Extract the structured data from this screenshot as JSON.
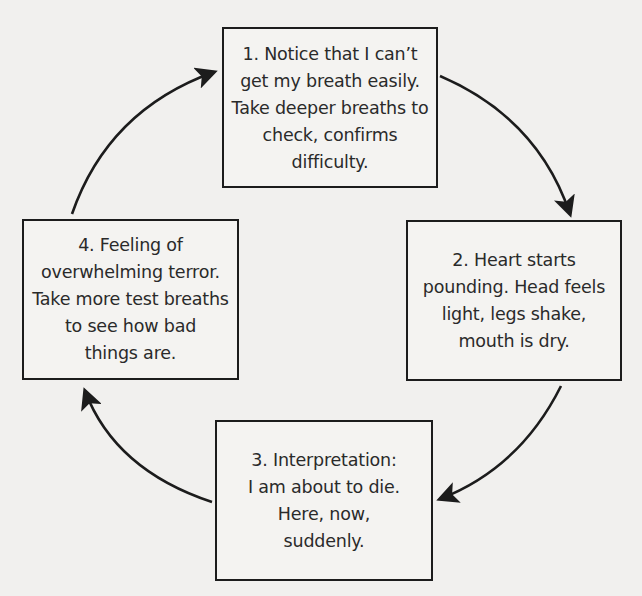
{
  "diagram": {
    "type": "cycle",
    "background_color": "#f1f0ee",
    "stroke_color": "#1c1c1c",
    "text_color": "#2a2a2a",
    "nodes": [
      {
        "id": "1",
        "lines": [
          "1. Notice that I can’t",
          "get my breath easily.",
          "Take deeper breaths to",
          "check, confirms",
          "difficulty."
        ]
      },
      {
        "id": "2",
        "lines": [
          "2. Heart starts",
          "pounding. Head feels",
          "light, legs shake,",
          "mouth is dry."
        ]
      },
      {
        "id": "3",
        "lines": [
          "3. Interpretation:",
          "I am about to die.",
          "Here, now,",
          "suddenly."
        ]
      },
      {
        "id": "4",
        "lines": [
          "4. Feeling of",
          "overwhelming terror.",
          "Take more test breaths",
          "to see how bad",
          "things are."
        ]
      }
    ],
    "edges": [
      {
        "from": "1",
        "to": "2"
      },
      {
        "from": "2",
        "to": "3"
      },
      {
        "from": "3",
        "to": "4"
      },
      {
        "from": "4",
        "to": "1"
      }
    ]
  }
}
